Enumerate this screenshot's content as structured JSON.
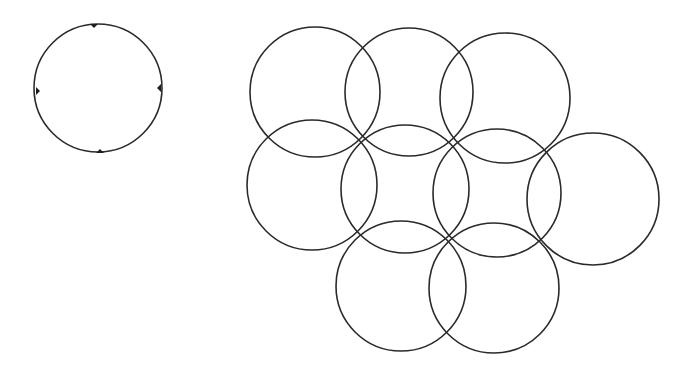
{
  "diagram": {
    "stroke_color": "#2a2a2a",
    "background": "#ffffff",
    "single_circle": {
      "cx": 98,
      "cy": 88,
      "r": 64,
      "marks": [
        {
          "x": 94,
          "y": 24,
          "pos": "top"
        },
        {
          "x": 161,
          "y": 88,
          "pos": "right"
        },
        {
          "x": 100,
          "y": 153,
          "pos": "bottom"
        },
        {
          "x": 36,
          "y": 91,
          "pos": "left"
        }
      ]
    },
    "cluster": [
      {
        "cx": 315,
        "cy": 92,
        "r": 65
      },
      {
        "cx": 409,
        "cy": 92,
        "r": 64
      },
      {
        "cx": 505,
        "cy": 98,
        "r": 65
      },
      {
        "cx": 312,
        "cy": 185,
        "r": 65
      },
      {
        "cx": 405,
        "cy": 189,
        "r": 64
      },
      {
        "cx": 497,
        "cy": 193,
        "r": 64
      },
      {
        "cx": 593,
        "cy": 199,
        "r": 66
      },
      {
        "cx": 401,
        "cy": 286,
        "r": 65
      },
      {
        "cx": 494,
        "cy": 288,
        "r": 65
      }
    ]
  }
}
